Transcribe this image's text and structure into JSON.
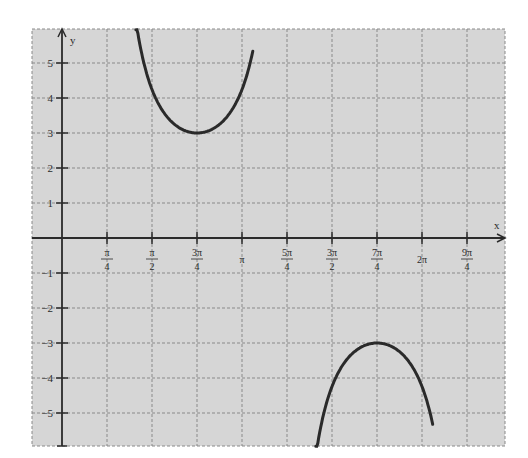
{
  "chart_data": {
    "type": "line",
    "title": "",
    "function": "y = 3 csc(x - π/4)",
    "xlabel": "x",
    "ylabel": "y",
    "xlim": [
      -0.23,
      7.45
    ],
    "ylim": [
      -6,
      6
    ],
    "grid": true,
    "x_ticks": [
      {
        "value": 0.7854,
        "num": "π",
        "den": "4"
      },
      {
        "value": 1.5708,
        "num": "π",
        "den": "2"
      },
      {
        "value": 2.3562,
        "num": "3π",
        "den": "4"
      },
      {
        "value": 3.1416,
        "label": "π"
      },
      {
        "value": 3.927,
        "num": "5π",
        "den": "4"
      },
      {
        "value": 4.7124,
        "num": "3π",
        "den": "2"
      },
      {
        "value": 5.4978,
        "num": "7π",
        "den": "4"
      },
      {
        "value": 6.2832,
        "label": "2π"
      },
      {
        "value": 7.0686,
        "num": "9π",
        "den": "4"
      }
    ],
    "y_ticks": [
      "5",
      "4",
      "3",
      "2",
      "1",
      "-1",
      "-2",
      "-3",
      "-4",
      "-5"
    ],
    "series": [
      {
        "name": "upper branch",
        "x": [
          1.29,
          1.57,
          1.96,
          2.36,
          2.75,
          3.14,
          3.33
        ],
        "y": [
          5.9,
          4.24,
          3.25,
          3.0,
          3.25,
          4.24,
          5.9
        ]
      },
      {
        "name": "lower branch",
        "x": [
          4.43,
          4.71,
          5.11,
          5.5,
          5.89,
          6.28,
          6.47
        ],
        "y": [
          -5.9,
          -4.24,
          -3.25,
          -3.0,
          -3.25,
          -4.24,
          -5.9
        ]
      }
    ],
    "key_points": [
      {
        "x": "3π/4",
        "y": 3,
        "type": "local minimum"
      },
      {
        "x": "7π/4",
        "y": -3,
        "type": "local maximum"
      }
    ],
    "colors": {
      "background": "#d6d6d6",
      "grid": "#8a8a8a",
      "axis": "#2b2b2b",
      "curve": "#2a2a2a"
    }
  },
  "labels": {
    "x_axis": "x",
    "y_axis": "y"
  }
}
